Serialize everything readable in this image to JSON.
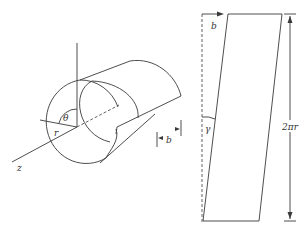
{
  "figure": {
    "left": {
      "name": "cylinder-with-screw-dislocation",
      "labels": {
        "theta": "θ",
        "r": "r",
        "z": "z",
        "b": "b"
      }
    },
    "right": {
      "name": "unrolled-cylinder-surface",
      "labels": {
        "b": "b",
        "gamma": "γ",
        "circumference": "2πr"
      }
    },
    "colors": {
      "line": "#3a3a3a",
      "background": "#ffffff"
    }
  }
}
